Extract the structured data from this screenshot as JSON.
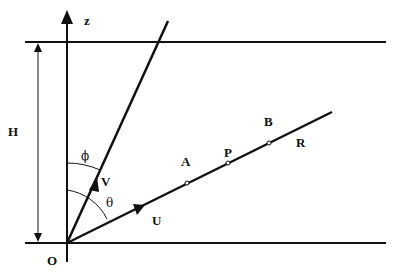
{
  "diagram": {
    "type": "geometry-schematic",
    "labels": {
      "z_axis": "z",
      "height": "H",
      "origin": "O",
      "ray_v": "V",
      "ray_u": "U",
      "angle_phi": "ϕ",
      "angle_theta": "θ",
      "point_a": "A",
      "point_p": "P",
      "point_b": "B",
      "point_r": "R"
    },
    "geometry": {
      "origin": [
        67,
        243
      ],
      "top_boundary_y": 42,
      "bottom_boundary_y": 243,
      "boundary_x_range": [
        25,
        386
      ],
      "z_axis_top": [
        67,
        12
      ],
      "z_axis_bottom": [
        67,
        262
      ],
      "ray_v_end": [
        168,
        21
      ],
      "ray_u_end": [
        332,
        112
      ],
      "height_arrow_x": 38,
      "points_on_u": {
        "A": [
          187,
          183
        ],
        "P": [
          228,
          163
        ],
        "B": [
          269,
          143
        ]
      }
    },
    "colors": {
      "line": "#111111",
      "background": "#ffffff"
    }
  }
}
